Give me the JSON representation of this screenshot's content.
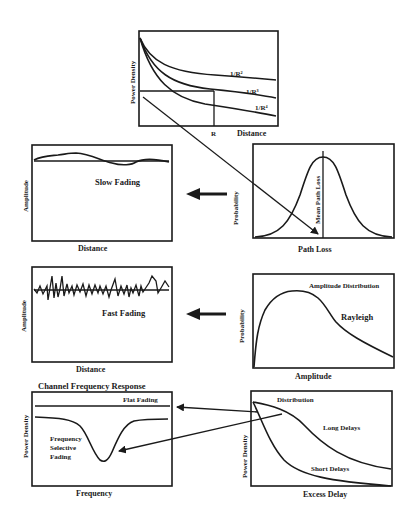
{
  "figure": {
    "panels": {
      "path_loss_vs_distance": {
        "ylabel": "Power Density",
        "xlabel": "Distance",
        "r_marker": "R",
        "curves": [
          "1/R²",
          "1/R³",
          "1/R⁴"
        ]
      },
      "slow_fading": {
        "ylabel": "Amplitude",
        "xlabel": "Distance",
        "annotation": "Slow Fading"
      },
      "path_loss_distribution": {
        "ylabel": "Probability",
        "xlabel": "Path Loss",
        "annotation": "Mean Path Loss"
      },
      "fast_fading": {
        "ylabel": "Amplitude",
        "xlabel": "Distance",
        "annotation": "Fast Fading"
      },
      "amplitude_distribution": {
        "ylabel": "Probability",
        "xlabel": "Amplitude",
        "title": "Amplitude Distribution",
        "annotation": "Rayleigh"
      },
      "channel_frequency_response": {
        "title": "Channel Frequency Response",
        "ylabel": "Power Density",
        "xlabel": "Frequency",
        "flat_label": "Flat Fading",
        "selective_label_line1": "Frequency",
        "selective_label_line2": "Selective",
        "selective_label_line3": "Fading"
      },
      "delay_distribution": {
        "ylabel": "Power Density",
        "xlabel": "Excess Delay",
        "title": "Distribution",
        "long_label": "Long Delays",
        "short_label": "Short Delays"
      }
    },
    "colors": {
      "ink": "#1a1a1a",
      "background": "#ffffff"
    }
  }
}
